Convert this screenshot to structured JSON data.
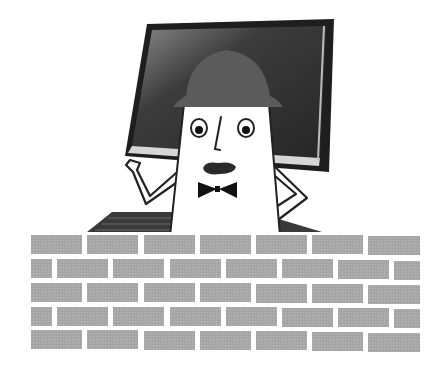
{
  "illustration": {
    "description": "Cartoon character wearing a helmet and bow tie standing in front of a computer monitor, behind a brick wall",
    "colors": {
      "background": "#ffffff",
      "monitor_frame": "#2a2a2a",
      "monitor_screen": "#3a3a3a",
      "monitor_bezel_light": "#d8d8d8",
      "helmet": "#5a5a5a",
      "character_body": "#ffffff",
      "outline": "#222222",
      "bow_tie": "#111111",
      "mouth": "#2a2a2a",
      "keyboard": "#3c3c3c",
      "brick": "#a9a9a9",
      "mortar": "#ffffff"
    },
    "brick_wall": {
      "rows": 5,
      "x_start": 31,
      "x_end": 420,
      "row_tops": [
        235,
        259,
        283,
        307,
        330
      ],
      "brick_height": 19,
      "brick_width": 51,
      "gap": 5
    }
  }
}
